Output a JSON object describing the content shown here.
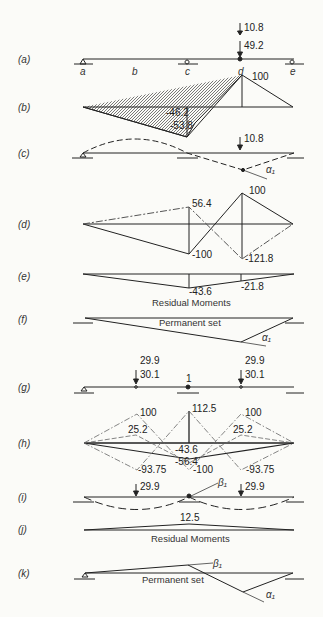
{
  "figure": {
    "panels": [
      {
        "id": "a",
        "tag": "(a)",
        "labels": {
          "points": [
            "a",
            "b",
            "c",
            "d",
            "e"
          ],
          "load_top": "10.8",
          "load_bottom": "49.2"
        }
      },
      {
        "id": "b",
        "tag": "(b)",
        "labels": {
          "peak": "100",
          "v1": "-46.2",
          "v2": "-53.8"
        }
      },
      {
        "id": "c",
        "tag": "(c)",
        "labels": {
          "load": "10.8",
          "angle": "α₁"
        }
      },
      {
        "id": "d",
        "tag": "(d)",
        "labels": {
          "v1": "56.4",
          "v2": "100",
          "v3": "-100",
          "v4": "-121.8"
        }
      },
      {
        "id": "e",
        "tag": "(e)",
        "labels": {
          "v1": "-43.6",
          "v2": "-21.8",
          "title": "Residual Moments"
        }
      },
      {
        "id": "f",
        "tag": "(f)",
        "labels": {
          "title": "Permanent set",
          "angle": "α₁"
        }
      },
      {
        "id": "g",
        "tag": "(g)",
        "labels": {
          "load_top_left": "29.9",
          "load_top_right": "29.9",
          "load_left": "30.1",
          "load_right": "30.1",
          "center": "1"
        }
      },
      {
        "id": "h",
        "tag": "(h)",
        "labels": {
          "peak": "112.5",
          "left_top": "100",
          "right_top": "100",
          "left_mid": "25.2",
          "right_mid": "25.2",
          "v1": "-43.6",
          "v2": "-56.4",
          "v3": "-100",
          "left_bot": "-93.75",
          "right_bot": "-93.75"
        }
      },
      {
        "id": "i",
        "tag": "(i)",
        "labels": {
          "load_left": "29.9",
          "load_right": "29.9",
          "angle": "β₁"
        }
      },
      {
        "id": "j",
        "tag": "(j)",
        "labels": {
          "peak": "12.5",
          "title": "Residual Moments"
        }
      },
      {
        "id": "k",
        "tag": "(k)",
        "labels": {
          "title": "Permanent set",
          "angle_beta": "β₁",
          "angle_alpha": "α₁"
        }
      }
    ]
  }
}
